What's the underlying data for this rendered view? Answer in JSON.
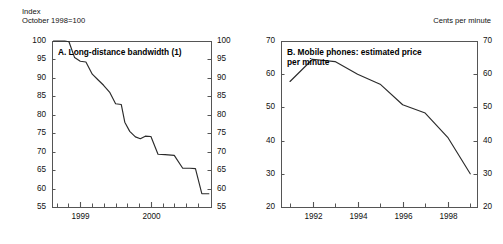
{
  "figure": {
    "background": "#ffffff",
    "line_color": "#2b2b2b",
    "frame_color": "#555555"
  },
  "panels": [
    {
      "id": "panel-a",
      "unit_header": "Index\nOctober 1998=100",
      "title": "A. Long-distance bandwidth (1)"
    },
    {
      "id": "panel-b",
      "unit_header": "Cents per minute",
      "title": "B. Mobile phones: estimated price\n   per minute"
    }
  ],
  "chart_data": [
    {
      "type": "line",
      "title": "A. Long-distance bandwidth (1)",
      "subtitle": "Index, October 1998=100",
      "xlabel": "",
      "ylabel": "Index (October 1998=100)",
      "ylim": [
        55,
        100
      ],
      "xlim": [
        1998.6,
        2000.85
      ],
      "yticks": [
        55,
        60,
        65,
        70,
        75,
        80,
        85,
        90,
        95,
        100
      ],
      "xticks": [
        1999,
        2000
      ],
      "xticklabels": [
        "1999",
        "2000"
      ],
      "grid": false,
      "legend": "none",
      "dual_y_axis": true,
      "x": [
        1998.62,
        1998.78,
        1998.84,
        1998.92,
        1999.0,
        1999.08,
        1999.17,
        1999.25,
        1999.33,
        1999.42,
        1999.5,
        1999.58,
        1999.63,
        1999.7,
        1999.78,
        1999.85,
        1999.92,
        2000.0,
        2000.1,
        2000.2,
        2000.33,
        2000.45,
        2000.55,
        2000.63,
        2000.72,
        2000.82
      ],
      "values": [
        100.0,
        100.0,
        99.8,
        95.5,
        94.5,
        94.3,
        91.0,
        89.5,
        88.0,
        86.0,
        83.0,
        82.8,
        78.0,
        75.5,
        74.0,
        73.5,
        74.2,
        74.1,
        69.3,
        69.2,
        69.0,
        65.5,
        65.5,
        65.4,
        58.6,
        58.6
      ]
    },
    {
      "type": "line",
      "title": "B. Mobile phones: estimated price per minute",
      "subtitle": "Cents per minute",
      "xlabel": "",
      "ylabel": "Cents per minute",
      "ylim": [
        20,
        70
      ],
      "xlim": [
        1990.6,
        1999.3
      ],
      "yticks": [
        20,
        30,
        40,
        50,
        60,
        70
      ],
      "xticks": [
        1992,
        1994,
        1996,
        1998
      ],
      "xticklabels": [
        "1992",
        "1994",
        "1996",
        "1998"
      ],
      "grid": false,
      "legend": "none",
      "dual_y_axis": true,
      "x": [
        1991,
        1992,
        1993,
        1994,
        1995,
        1996,
        1997,
        1998,
        1999
      ],
      "values": [
        57.8,
        64.5,
        63.8,
        60.0,
        57.0,
        50.8,
        48.3,
        41.0,
        30.0
      ]
    }
  ]
}
